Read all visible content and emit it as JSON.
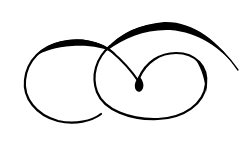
{
  "artwork": {
    "title": "Calligraphic flourish ornament",
    "description": "Black double-loop swirl flourish with a teardrop terminal on white background",
    "colors": {
      "background": "#ffffff",
      "ink": "#000000"
    }
  }
}
